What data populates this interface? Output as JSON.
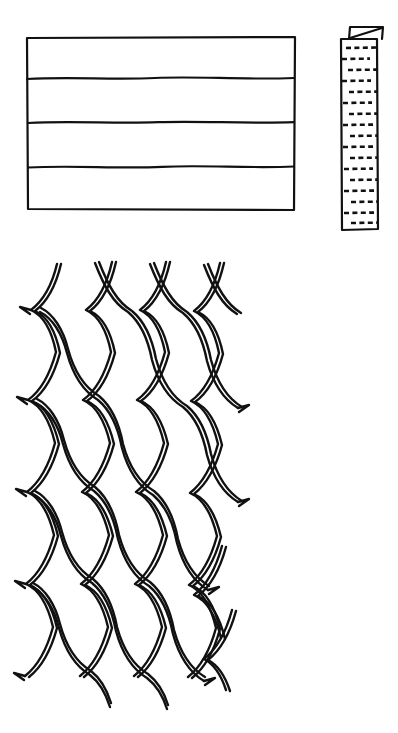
{
  "page": {
    "kind": "scanned-line-art-figure",
    "paper_color": "#ffffff",
    "ink_color": "#111111",
    "width": 398,
    "height": 733,
    "caption": ""
  },
  "artifacts": {
    "corner_mark_label": "scan-edge-mark"
  },
  "figures": [
    {
      "id": "banded-rectangle",
      "label": "banded rectangle panel",
      "description": "Rectangle divided by three hand-drawn horizontal lines into four horizontal bands.",
      "bounds": {
        "x": 26,
        "y": 37,
        "width": 269,
        "height": 173
      },
      "band_count": 4,
      "divider_y": [
        78,
        122,
        166
      ],
      "stroke_width": 2.2
    },
    {
      "id": "dashed-strip",
      "label": "narrow vertical strip with stitch rows",
      "description": "Tall narrow strip with a folded flap at top crossed by a diagonal line, and many rows of short dashes.",
      "bounds": {
        "x": 340,
        "y": 38,
        "width": 38,
        "height": 192
      },
      "flap": {
        "x": 347,
        "y": 26,
        "width": 36,
        "height": 14,
        "has_diagonal": true
      },
      "dash_row_count": 17,
      "stroke_width": 2.2
    },
    {
      "id": "diamond-mesh-net",
      "label": "slanted diamond mesh netting",
      "description": "Hand-drawn net of curved diamond cells outlined with doubled strands, skewing rightward toward the bottom, with cut V-shaped spurs along the left and right edges.",
      "bounds": {
        "x": 18,
        "y": 262,
        "width": 222,
        "height": 460
      },
      "columns": 4,
      "rows": 7,
      "stroke_width": 2.4,
      "strand_gap": 3.2
    }
  ]
}
